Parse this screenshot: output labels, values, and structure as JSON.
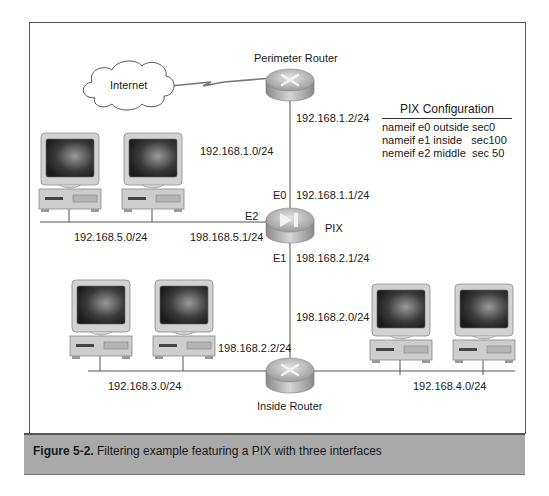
{
  "figure": {
    "number": "Figure 5-2.",
    "caption": "Filtering example featuring a PIX with three interfaces"
  },
  "nodes": {
    "internet": {
      "label": "Internet"
    },
    "perimeter_router": {
      "label": "Perimeter Router"
    },
    "pix": {
      "label": "PIX"
    },
    "inside_router": {
      "label": "Inside Router"
    }
  },
  "interfaces": {
    "e0": "E0",
    "e1": "E1",
    "e2": "E2"
  },
  "addresses": {
    "perimeter_router_ip": "192.168.1.2/24",
    "outside_network": "192.168.1.0/24",
    "pix_e0_ip": "192.168.1.1/24",
    "middle_network": "192.168.5.0/24",
    "pix_e2_ip": "198.168.5.1/24",
    "pix_e1_ip": "198.168.2.1/24",
    "inside_transit_network": "198.168.2.0/24",
    "inside_router_ip": "198.168.2.2/24",
    "left_lan": "192.168.3.0/24",
    "right_lan": "192.168.4.0/24"
  },
  "pix_config": {
    "title": "PIX Configuration",
    "lines": [
      "nameif e0 outside sec0",
      "nameif e1 inside   sec100",
      "nemeif e2 middle  sec 50"
    ]
  },
  "colors": {
    "caption_band": "#a9a9a9",
    "device_body": "#c8c8c8",
    "line": "#555555"
  }
}
